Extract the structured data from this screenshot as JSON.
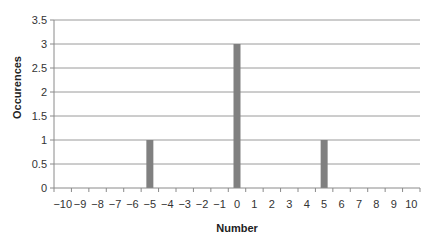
{
  "chart_data": {
    "type": "bar",
    "title": "",
    "xlabel": "Number",
    "ylabel": "Occurences",
    "categories": [
      "-10",
      "-9",
      "-8",
      "-7",
      "-6",
      "-5",
      "-4",
      "-3",
      "-2",
      "-1",
      "0",
      "1",
      "2",
      "3",
      "4",
      "5",
      "6",
      "7",
      "8",
      "9",
      "10"
    ],
    "values": [
      0,
      0,
      0,
      0,
      0,
      1,
      0,
      0,
      0,
      0,
      3,
      0,
      0,
      0,
      0,
      1,
      0,
      0,
      0,
      0,
      0
    ],
    "ylim": [
      0,
      3.5
    ],
    "yticks": [
      0,
      0.5,
      1,
      1.5,
      2,
      2.5,
      3,
      3.5
    ],
    "ytick_labels": [
      "0",
      "0.5",
      "1",
      "1.5",
      "2",
      "2.5",
      "3",
      "3.5"
    ],
    "xtick_labels": [
      "−10",
      "−9",
      "−8",
      "−7",
      "−6",
      "−5",
      "−4",
      "−3",
      "−2",
      "−1",
      "0",
      "1",
      "2",
      "3",
      "4",
      "5",
      "6",
      "7",
      "8",
      "9",
      "10"
    ],
    "grid": true,
    "legend": null,
    "colors": {
      "bar": "#808080",
      "grid": "#9a9a9a",
      "axis": "#8a8a8a",
      "text": "#333333"
    }
  }
}
